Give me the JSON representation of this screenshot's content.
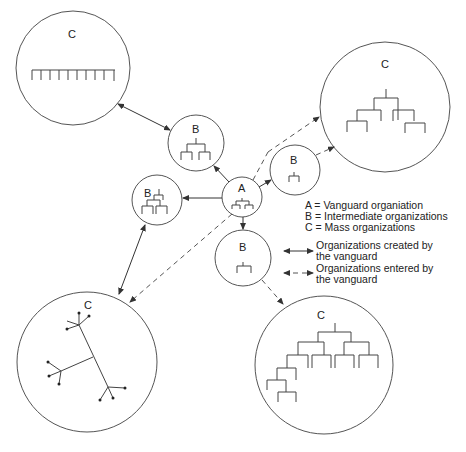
{
  "top_caption": "Organizational network diagram",
  "nodes": {
    "a": {
      "label": "A"
    },
    "b_top": {
      "label": "B"
    },
    "b_left": {
      "label": "B"
    },
    "b_right": {
      "label": "B"
    },
    "b_bottom": {
      "label": "B"
    },
    "c_top_left": {
      "label": "C"
    },
    "c_top_right": {
      "label": "C"
    },
    "c_bottom_left": {
      "label": "C"
    },
    "c_bottom_right": {
      "label": "C"
    }
  },
  "legend": {
    "keys": [
      "A = Vanguard organiation",
      "B = Intermediate organizations",
      "C = Mass organizations"
    ],
    "arrows": [
      {
        "style": "solid",
        "line1": "Organizations created by",
        "line2": "the vanguard"
      },
      {
        "style": "dashed",
        "line1": "Organizations entered by",
        "line2": "the vanguard"
      }
    ]
  }
}
